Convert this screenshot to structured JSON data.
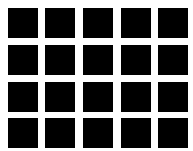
{
  "figure": {
    "rows": 4,
    "columns": 5,
    "square_color": "#000000",
    "background_color": "#ffffff",
    "square_size_px": 30,
    "column_positions_px": [
      8,
      45,
      83,
      121,
      158
    ],
    "row_positions_px": [
      8,
      45,
      82,
      118
    ]
  }
}
